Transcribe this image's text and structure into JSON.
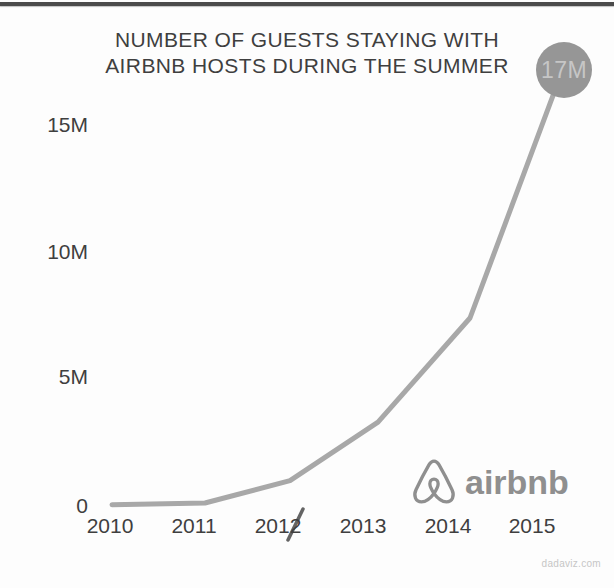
{
  "title": {
    "line1": "NUMBER OF GUESTS STAYING WITH",
    "line2": "AIRBNB HOSTS DURING THE SUMMER"
  },
  "annotation": {
    "label": "17M"
  },
  "axes": {
    "y_ticks_top_to_bottom": [
      "15M",
      "10M",
      "5M",
      "0"
    ],
    "x_ticks": [
      "2010",
      "2011",
      "2012",
      "2013",
      "2014",
      "2015"
    ]
  },
  "branding": {
    "icon": "airbnb-belo-icon",
    "wordmark": "airbnb"
  },
  "source": {
    "label": "dadaviz.com"
  },
  "colors": {
    "top_bar": "#4b4b4b",
    "text": "#3f3f3f",
    "accent_line": "#a8a8a8",
    "bubble": "#969696",
    "bubble_text": "#c6c6c6",
    "logo": "#8f8f8f",
    "source": "#c6c6c6",
    "bg": "#fdfdfd"
  },
  "chart_data": {
    "type": "line",
    "title": "NUMBER OF GUESTS STAYING WITH AIRBNB HOSTS DURING THE SUMMER",
    "categories": [
      "2010",
      "2011",
      "2012",
      "2013",
      "2014",
      "2015"
    ],
    "x": [
      2010,
      2011,
      2012,
      2013,
      2014,
      2015
    ],
    "values_millions": [
      0.05,
      0.12,
      1.0,
      3.3,
      7.4,
      17
    ],
    "unit": "guests (millions)",
    "ytick_values_millions": [
      0,
      5,
      10,
      15
    ],
    "ytick_labels": [
      "0",
      "5M",
      "10M",
      "15M"
    ],
    "ylim": [
      0,
      17.5
    ],
    "grid": false,
    "legend": null,
    "line_color": "#a8a8a8",
    "annotations": [
      {
        "x": 2015,
        "value_millions": 17,
        "label": "17M"
      }
    ]
  }
}
